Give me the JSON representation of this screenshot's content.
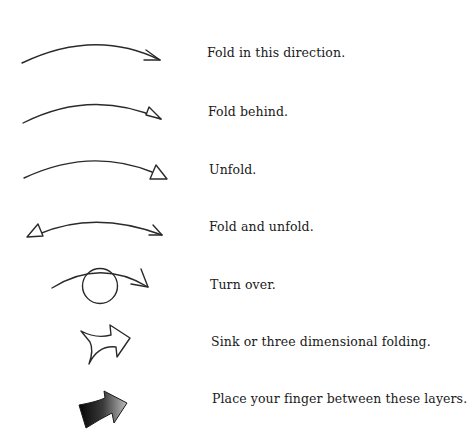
{
  "legend": {
    "items": [
      {
        "symbol": "valley-fold-arrow",
        "label": "Fold in this direction."
      },
      {
        "symbol": "mountain-fold-arrow",
        "label": "Fold behind."
      },
      {
        "symbol": "unfold-arrow",
        "label": "Unfold."
      },
      {
        "symbol": "fold-unfold-arrow",
        "label": "Fold and unfold."
      },
      {
        "symbol": "turn-over-arrow",
        "label": "Turn over."
      },
      {
        "symbol": "sink-arrow",
        "label": "Sink or three dimensional folding."
      },
      {
        "symbol": "finger-between-layers-arrow",
        "label": "Place your finger between these layers."
      }
    ]
  },
  "colors": {
    "stroke": "#2a2a2a",
    "text": "#1a1a1a",
    "background": "#ffffff"
  }
}
